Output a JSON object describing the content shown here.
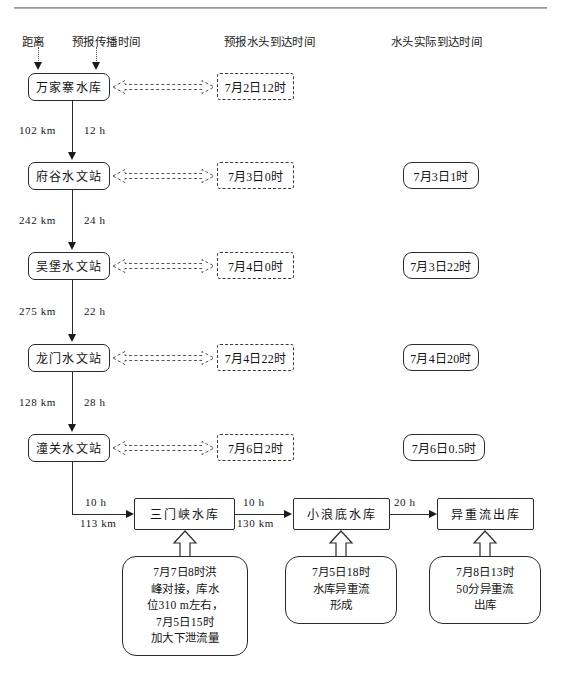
{
  "diagram": {
    "title_rule": "",
    "columns": [
      {
        "key": "distance",
        "label": "距离"
      },
      {
        "key": "travel_time",
        "label": "预报传播时间"
      },
      {
        "key": "forecast_arrival",
        "label": "预报水头到达时间"
      },
      {
        "key": "actual_arrival",
        "label": "水头实际到达时间"
      }
    ],
    "stations": [
      {
        "name": "万家寨水库",
        "forecast": "7月2日12时",
        "actual": ""
      },
      {
        "name": "府谷水文站",
        "forecast": "7月3日0时",
        "actual": "7月3日1时"
      },
      {
        "name": "吴堡水文站",
        "forecast": "7月4日0时",
        "actual": "7月3日22时"
      },
      {
        "name": "龙门水文站",
        "forecast": "7月4日22时",
        "actual": "7月4日20时"
      },
      {
        "name": "潼关水文站",
        "forecast": "7月6日2时",
        "actual": "7月6日0.5时"
      }
    ],
    "segments": [
      {
        "distance": "102 km",
        "time": "12 h"
      },
      {
        "distance": "242 km",
        "time": "24 h"
      },
      {
        "distance": "275 km",
        "time": "22 h"
      },
      {
        "distance": "128 km",
        "time": "28 h"
      }
    ],
    "lower_chain": {
      "link_from_tongguan": {
        "time": "10 h",
        "distance": "113 km"
      },
      "nodes": [
        {
          "name": "三门峡水库"
        },
        {
          "name": "小浪底水库"
        },
        {
          "name": "异重流出库"
        }
      ],
      "links": [
        {
          "time": "10 h",
          "distance": "130 km"
        },
        {
          "time": "20 h",
          "distance": ""
        }
      ],
      "notes": [
        {
          "lines": [
            "7月7日8时洪",
            "峰对接，库水",
            "位310 m左右，",
            "7月5日15时",
            "加大下泄流量"
          ]
        },
        {
          "lines": [
            "7月5日18时",
            "水库异重流",
            "形成"
          ]
        },
        {
          "lines": [
            "7月8日13时",
            "50分异重流",
            "出库"
          ]
        }
      ]
    },
    "colors": {
      "line": "#2b2b2b",
      "text": "#141414",
      "dashed": "#3a3a3a",
      "background": "#ffffff"
    }
  }
}
